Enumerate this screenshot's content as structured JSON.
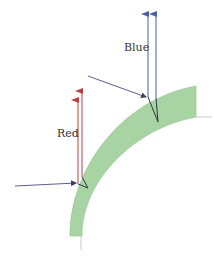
{
  "diagram": {
    "labels": {
      "blue": "Blue",
      "red": "Red"
    },
    "colors": {
      "band_fill": "#a8d4a4",
      "band_edge": "#8fc08a",
      "blue_ray": "#4a5fa8",
      "red_ray": "#b84040",
      "incident_ray": "#5a5f8a",
      "internal_ray": "#2f3540",
      "guide_line": "#bbbbbb"
    }
  }
}
